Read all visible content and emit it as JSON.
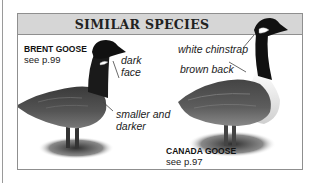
{
  "panel": {
    "title": "SIMILAR SPECIES",
    "header_bg": "#d6d6d6",
    "border_color": "#8f8f8f"
  },
  "species": [
    {
      "name": "BRENT GOOSE",
      "ref": "see p.99",
      "annotations": [
        "dark",
        "face",
        "smaller and",
        "darker"
      ]
    },
    {
      "name": "CANADA GOOSE",
      "ref": "see p.97",
      "annotations": [
        "white chinstrap",
        "brown back"
      ]
    }
  ]
}
